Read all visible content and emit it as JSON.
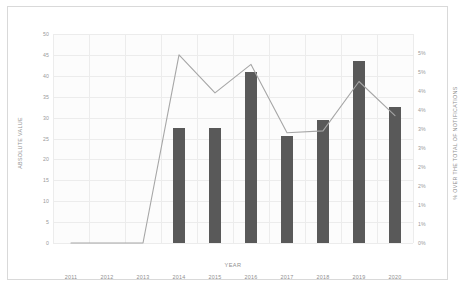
{
  "chart_data": {
    "type": "bar",
    "title": "",
    "subtitle": "",
    "xlabel": "YEAR",
    "ylabel": "ABSOLUTE VALUE",
    "y2label": "% OVER THE TOTAL OF NOTIFICATIONS",
    "categories": [
      "2011",
      "2012",
      "2013",
      "2014",
      "2015",
      "2016",
      "2017",
      "2018",
      "2019",
      "2020"
    ],
    "ylim": [
      0,
      50
    ],
    "y2lim": [
      0,
      5.5
    ],
    "yticks": [
      0,
      5,
      10,
      15,
      20,
      25,
      30,
      35,
      40,
      45,
      50
    ],
    "ytick_labels": [
      "0",
      "5",
      "10",
      "15",
      "20",
      "25",
      "30",
      "35",
      "40",
      "45",
      "50"
    ],
    "y2ticks": [
      0,
      0.5,
      1,
      1.5,
      2,
      2.5,
      3,
      3.5,
      4,
      4.5,
      5
    ],
    "y2tick_labels": [
      "0%",
      "1%",
      "1%",
      "2%",
      "2%",
      "3%",
      "3%",
      "4%",
      "4%",
      "5%",
      "5%"
    ],
    "grid": true,
    "legend": "none",
    "series": [
      {
        "name": "Absolute value",
        "kind": "bar",
        "axis": "left",
        "color": "#595959",
        "values": [
          0,
          0,
          0,
          27.5,
          27.5,
          41,
          25.5,
          29.5,
          43.5,
          32.5
        ]
      },
      {
        "name": "% over the total of notifications",
        "kind": "line",
        "axis": "right",
        "color": "#a6a6a6",
        "values": [
          0,
          0,
          0,
          4.95,
          3.95,
          4.7,
          2.9,
          2.95,
          4.25,
          3.35
        ]
      }
    ]
  }
}
